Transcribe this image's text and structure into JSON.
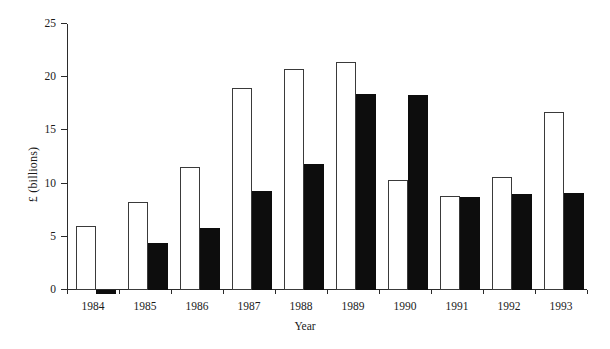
{
  "chart_data": {
    "type": "bar",
    "title": "",
    "xlabel": "Year",
    "ylabel": "£ (billions)",
    "categories": [
      "1984",
      "1985",
      "1986",
      "1987",
      "1988",
      "1989",
      "1990",
      "1991",
      "1992",
      "1993"
    ],
    "ylim": [
      0,
      25
    ],
    "yticks": [
      0,
      5,
      10,
      15,
      20,
      25
    ],
    "ytick_labels": [
      "0",
      "5",
      "10",
      "15",
      "20",
      "25"
    ],
    "grid": false,
    "legend": "none",
    "series": [
      {
        "name": "open-bar-series",
        "style": "open",
        "fill": "#ffffff",
        "stroke": "#3a3a3a",
        "values": [
          6.0,
          8.3,
          11.6,
          19.0,
          20.8,
          21.4,
          10.3,
          8.8,
          10.6,
          16.7
        ]
      },
      {
        "name": "solid-bar-series",
        "style": "solid",
        "fill": "#0d0d0d",
        "stroke": "#0d0d0d",
        "values": [
          -0.4,
          4.4,
          5.8,
          9.3,
          11.8,
          18.4,
          18.3,
          8.7,
          9.0,
          9.1
        ]
      }
    ]
  },
  "axes": {
    "y_label_text": "£ (billions)",
    "x_label_text": "Year"
  },
  "colors": {
    "axis": "#2b2b2b",
    "open_bar_fill": "#ffffff",
    "open_bar_stroke": "#3a3a3a",
    "solid_bar_fill": "#0d0d0d",
    "background": "#ffffff"
  }
}
